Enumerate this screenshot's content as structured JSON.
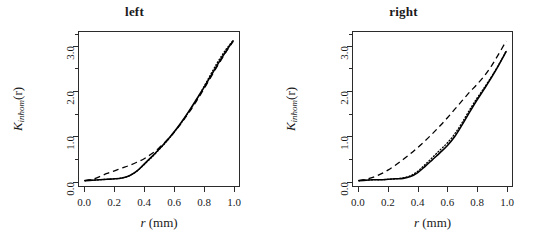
{
  "figure": {
    "background": "#ffffff",
    "axis_color": "#2b2b2b",
    "curve_color": "#000000"
  },
  "axes": {
    "x": {
      "title_var": "r",
      "title_unit": "(mm)",
      "ticks": [
        "0.0",
        "0.2",
        "0.4",
        "0.6",
        "0.8",
        "1.0"
      ],
      "tick_values": [
        0.0,
        0.2,
        0.4,
        0.6,
        0.8,
        1.0
      ],
      "xlim": [
        -0.04,
        1.04
      ]
    },
    "y": {
      "title_var": "K",
      "title_sub": "inhom",
      "title_arg": "(r)",
      "ticks": [
        "0.0",
        "1.0",
        "2.0",
        "3.0"
      ],
      "tick_values": [
        0.0,
        1.0,
        2.0,
        3.0
      ],
      "minor_tick_values": [
        0.5,
        1.5,
        2.5,
        3.25
      ],
      "ylim": [
        -0.12,
        3.32
      ]
    }
  },
  "chart_data": [
    {
      "type": "line",
      "title": "left",
      "xlabel": "r (mm)",
      "ylabel": "K_inhom(r)",
      "xlim": [
        -0.04,
        1.04
      ],
      "ylim": [
        -0.12,
        3.32
      ],
      "grid": false,
      "legend": "none",
      "x": [
        0.0,
        0.05,
        0.1,
        0.15,
        0.2,
        0.25,
        0.3,
        0.35,
        0.4,
        0.45,
        0.5,
        0.55,
        0.6,
        0.65,
        0.7,
        0.75,
        0.8,
        0.85,
        0.9,
        0.95,
        1.0
      ],
      "series": [
        {
          "name": "empirical",
          "style": "solid",
          "values": [
            0.0,
            0.01,
            0.02,
            0.03,
            0.04,
            0.06,
            0.11,
            0.21,
            0.37,
            0.53,
            0.7,
            0.88,
            1.08,
            1.3,
            1.54,
            1.8,
            2.06,
            2.34,
            2.62,
            2.88,
            3.12
          ]
        },
        {
          "name": "theoretical",
          "style": "dashed",
          "values": [
            0.0,
            0.03,
            0.09,
            0.16,
            0.22,
            0.28,
            0.34,
            0.41,
            0.49,
            0.6,
            0.73,
            0.89,
            1.07,
            1.28,
            1.51,
            1.76,
            2.03,
            2.31,
            2.59,
            2.86,
            3.11
          ]
        },
        {
          "name": "alternative",
          "style": "dotted",
          "values": [
            0.0,
            0.01,
            0.02,
            0.03,
            0.04,
            0.06,
            0.11,
            0.21,
            0.36,
            0.52,
            0.69,
            0.87,
            1.07,
            1.29,
            1.53,
            1.79,
            2.08,
            2.38,
            2.67,
            2.92,
            3.13
          ]
        }
      ]
    },
    {
      "type": "line",
      "title": "right",
      "xlabel": "r (mm)",
      "ylabel": "K_inhom(r)",
      "xlim": [
        -0.04,
        1.04
      ],
      "ylim": [
        -0.12,
        3.32
      ],
      "grid": false,
      "legend": "none",
      "x": [
        0.0,
        0.05,
        0.1,
        0.15,
        0.2,
        0.25,
        0.3,
        0.35,
        0.4,
        0.45,
        0.5,
        0.55,
        0.6,
        0.65,
        0.7,
        0.75,
        0.8,
        0.85,
        0.9,
        0.95,
        1.0
      ],
      "series": [
        {
          "name": "empirical",
          "style": "solid",
          "values": [
            0.0,
            0.01,
            0.02,
            0.02,
            0.03,
            0.04,
            0.05,
            0.09,
            0.18,
            0.32,
            0.47,
            0.62,
            0.78,
            0.98,
            1.24,
            1.52,
            1.79,
            2.04,
            2.3,
            2.58,
            2.88
          ]
        },
        {
          "name": "theoretical",
          "style": "dashed",
          "values": [
            0.0,
            0.03,
            0.08,
            0.15,
            0.24,
            0.35,
            0.47,
            0.6,
            0.74,
            0.89,
            1.05,
            1.22,
            1.4,
            1.59,
            1.78,
            1.97,
            2.14,
            2.33,
            2.56,
            2.83,
            3.12
          ]
        },
        {
          "name": "alternative",
          "style": "dotted",
          "values": [
            0.0,
            0.01,
            0.02,
            0.02,
            0.03,
            0.04,
            0.06,
            0.11,
            0.21,
            0.36,
            0.52,
            0.68,
            0.84,
            1.04,
            1.29,
            1.57,
            1.83,
            2.07,
            2.32,
            2.59,
            2.89
          ]
        }
      ]
    }
  ]
}
